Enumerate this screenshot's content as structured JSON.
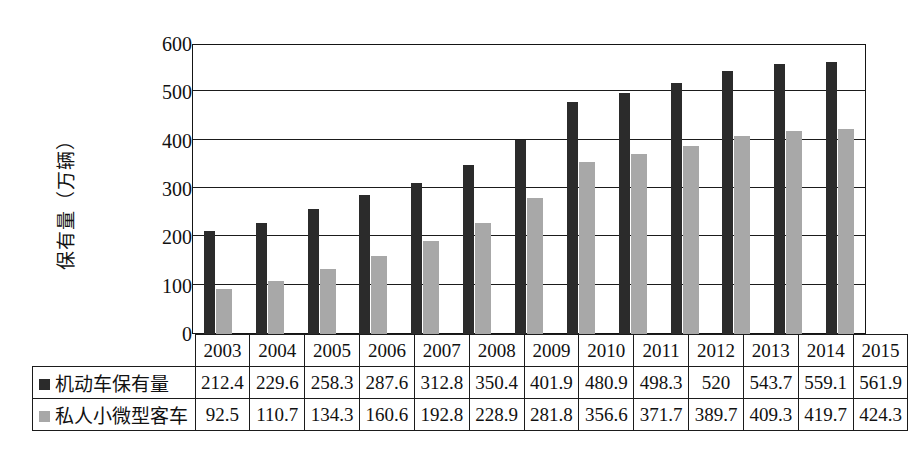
{
  "chart_data": {
    "type": "bar",
    "title": "",
    "subtitle": "",
    "xlabel": "",
    "ylabel": "保有量（万辆）",
    "ylim": [
      0,
      600
    ],
    "ytick_values": [
      0,
      100,
      200,
      300,
      400,
      500,
      600
    ],
    "ytick_labels": [
      "0",
      "100",
      "200",
      "300",
      "400",
      "500",
      "600"
    ],
    "grid": true,
    "legend_position": "table-row-headers",
    "categories": [
      "2003",
      "2004",
      "2005",
      "2006",
      "2007",
      "2008",
      "2009",
      "2010",
      "2011",
      "2012",
      "2013",
      "2014",
      "2015"
    ],
    "series": [
      {
        "name": "机动车保有量",
        "color": "#2b2b2b",
        "values": [
          212.4,
          229.6,
          258.3,
          287.6,
          312.8,
          350.4,
          401.9,
          480.9,
          498.3,
          520,
          543.7,
          559.1,
          561.9
        ],
        "labels": [
          "212.4",
          "229.6",
          "258.3",
          "287.6",
          "312.8",
          "350.4",
          "401.9",
          "480.9",
          "498.3",
          "520",
          "543.7",
          "559.1",
          "561.9"
        ]
      },
      {
        "name": "私人小微型客车",
        "color": "#a8a8a8",
        "values": [
          92.5,
          110.7,
          134.3,
          160.6,
          192.8,
          228.9,
          281.8,
          356.6,
          371.7,
          389.7,
          409.3,
          419.7,
          424.3
        ],
        "labels": [
          "92.5",
          "110.7",
          "134.3",
          "160.6",
          "192.8",
          "228.9",
          "281.8",
          "356.6",
          "371.7",
          "389.7",
          "409.3",
          "419.7",
          "424.3"
        ]
      }
    ]
  },
  "colors": {
    "series_dark": "#2b2b2b",
    "series_light": "#a8a8a8",
    "axis": "#1b1b1b",
    "background": "#ffffff"
  }
}
